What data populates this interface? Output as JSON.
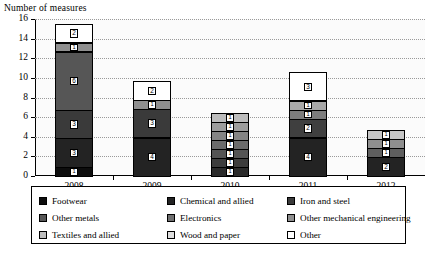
{
  "chart_data": {
    "type": "bar",
    "stacked": true,
    "title": "",
    "ylabel": "Number of measures",
    "xlabel": "",
    "ylim": [
      0,
      16
    ],
    "ytick_step": 2,
    "yticks": [
      0,
      2,
      4,
      6,
      8,
      10,
      12,
      14,
      16
    ],
    "grid": true,
    "legend_position": "bottom",
    "categories": [
      "2008",
      "2009",
      "2010",
      "2011",
      "2012"
    ],
    "series": [
      {
        "name": "Footwear",
        "color": "#0d0d0d",
        "values": [
          1,
          0,
          1,
          0,
          0
        ]
      },
      {
        "name": "Chemical and allied",
        "color": "#232323",
        "values": [
          3,
          4,
          1,
          4,
          2
        ]
      },
      {
        "name": "Iron and steel",
        "color": "#3a3a3a",
        "values": [
          3,
          3,
          1,
          2,
          0
        ]
      },
      {
        "name": "Other metals",
        "color": "#565656",
        "values": [
          6,
          0,
          1,
          0,
          1
        ]
      },
      {
        "name": "Electronics",
        "color": "#6f6f6f",
        "values": [
          0,
          0,
          1,
          1,
          0
        ]
      },
      {
        "name": "Other mechanical engineering",
        "color": "#8f8f8f",
        "values": [
          1,
          1,
          1,
          1,
          1
        ]
      },
      {
        "name": "Textiles and allied",
        "color": "#bdbdbd",
        "values": [
          0,
          0,
          1,
          0,
          1
        ]
      },
      {
        "name": "Wood and paper",
        "color": "#dedede",
        "values": [
          0,
          0,
          0,
          0,
          0
        ]
      },
      {
        "name": "Other",
        "color": "#ffffff",
        "values": [
          2,
          2,
          0,
          3,
          0
        ]
      }
    ],
    "totals": [
      16,
      10,
      7,
      11,
      5
    ],
    "stacks": [
      {
        "category": "2008",
        "segments": [
          {
            "series": "Footwear",
            "value": 1,
            "label": "1",
            "color": "#0d0d0d"
          },
          {
            "series": "Chemical and allied",
            "value": 3,
            "label": "3",
            "color": "#232323"
          },
          {
            "series": "Iron and steel",
            "value": 3,
            "label": "3",
            "color": "#3a3a3a"
          },
          {
            "series": "Other metals",
            "value": 6,
            "label": "6",
            "color": "#565656"
          },
          {
            "series": "Other mechanical engineering",
            "value": 1,
            "label": "1",
            "color": "#8f8f8f"
          },
          {
            "series": "Other",
            "value": 2,
            "label": "2",
            "color": "#ffffff"
          }
        ]
      },
      {
        "category": "2009",
        "segments": [
          {
            "series": "Chemical and allied",
            "value": 4,
            "label": "4",
            "color": "#232323"
          },
          {
            "series": "Iron and steel",
            "value": 3,
            "label": "3",
            "color": "#3a3a3a"
          },
          {
            "series": "Other mechanical engineering",
            "value": 1,
            "label": "1",
            "color": "#8f8f8f"
          },
          {
            "series": "Other",
            "value": 2,
            "label": "2",
            "color": "#ffffff"
          }
        ]
      },
      {
        "category": "2010",
        "segments": [
          {
            "series": "Footwear",
            "value": 1,
            "label": "1",
            "color": "#2b2b2b"
          },
          {
            "series": "Chemical and allied",
            "value": 1,
            "label": "1",
            "color": "#3d3d3d"
          },
          {
            "series": "Iron and steel",
            "value": 1,
            "label": "1",
            "color": "#545454"
          },
          {
            "series": "Other metals",
            "value": 1,
            "label": "1",
            "color": "#6b6b6b"
          },
          {
            "series": "Electronics",
            "value": 1,
            "label": "1",
            "color": "#848484"
          },
          {
            "series": "Other mechanical engineering",
            "value": 1,
            "label": "1",
            "color": "#9d9d9d"
          },
          {
            "series": "Textiles and allied",
            "value": 1,
            "label": "1",
            "color": "#bdbdbd"
          }
        ]
      },
      {
        "category": "2011",
        "segments": [
          {
            "series": "Chemical and allied",
            "value": 4,
            "label": "4",
            "color": "#232323"
          },
          {
            "series": "Iron and steel",
            "value": 2,
            "label": "2",
            "color": "#3f3f3f"
          },
          {
            "series": "Electronics",
            "value": 1,
            "label": "1",
            "color": "#7d7d7d"
          },
          {
            "series": "Other mechanical engineering",
            "value": 1,
            "label": "1",
            "color": "#a8a8a8"
          },
          {
            "series": "Other",
            "value": 3,
            "label": "3",
            "color": "#ffffff"
          }
        ]
      },
      {
        "category": "2012",
        "segments": [
          {
            "series": "Chemical and allied",
            "value": 2,
            "label": "2",
            "color": "#232323"
          },
          {
            "series": "Other metals",
            "value": 1,
            "label": "1",
            "color": "#5e5e5e"
          },
          {
            "series": "Other mechanical engineering",
            "value": 1,
            "label": "1",
            "color": "#8f8f8f"
          },
          {
            "series": "Textiles and allied",
            "value": 1,
            "label": "1",
            "color": "#c6c6c6"
          }
        ]
      }
    ]
  },
  "axis": {
    "y_title": "Number of measures"
  },
  "legend": {
    "entries": [
      {
        "label": "Footwear",
        "color": "#0d0d0d"
      },
      {
        "label": "Chemical and allied",
        "color": "#232323"
      },
      {
        "label": "Iron and steel",
        "color": "#3a3a3a"
      },
      {
        "label": "Other metals",
        "color": "#565656"
      },
      {
        "label": "Electronics",
        "color": "#6f6f6f"
      },
      {
        "label": "Other mechanical engineering",
        "color": "#8f8f8f"
      },
      {
        "label": "Textiles and allied",
        "color": "#bdbdbd"
      },
      {
        "label": "Wood and paper",
        "color": "#dedede"
      },
      {
        "label": "Other",
        "color": "#ffffff"
      }
    ]
  }
}
